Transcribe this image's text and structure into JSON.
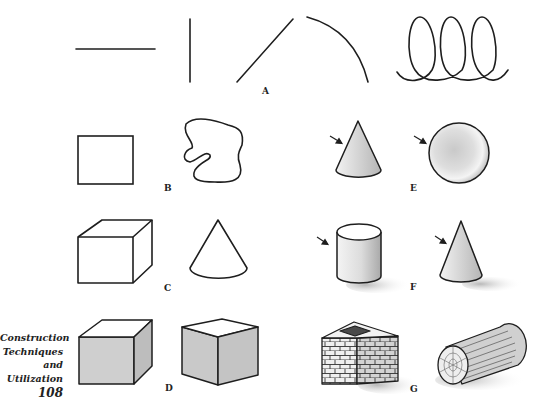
{
  "figure": {
    "labels": {
      "A": "A",
      "B": "B",
      "C": "C",
      "D": "D",
      "E": "E",
      "F": "F",
      "G": "G"
    },
    "rows": [
      {
        "label": "A",
        "items": [
          "horizontal-line",
          "vertical-line",
          "diagonal-line",
          "arc",
          "coil-loops"
        ]
      },
      {
        "label": "B",
        "items": [
          "square-outline",
          "freeform-blob-outline"
        ]
      },
      {
        "label": "C",
        "items": [
          "cube-outline",
          "cone-outline"
        ]
      },
      {
        "label": "D",
        "items": [
          "shaded-cube-front",
          "shaded-cube-corner"
        ]
      },
      {
        "label": "E",
        "items": [
          "shaded-cone-with-light-arrow",
          "shaded-sphere-with-light-arrow"
        ]
      },
      {
        "label": "F",
        "items": [
          "cylinder-with-cast-shadow",
          "cone-with-cast-shadow"
        ]
      },
      {
        "label": "G",
        "items": [
          "brick-chimney-block",
          "wooden-log"
        ]
      }
    ]
  },
  "caption": {
    "line1": "Construction",
    "line2": "Techniques",
    "line3": "and",
    "line4": "Utilization",
    "page_number": "108"
  },
  "colors": {
    "ink": "#1e1e1e",
    "shade_light": "#e6e6e6",
    "shade_mid": "#bdbdbd",
    "shadow": "#c8c8c8"
  }
}
